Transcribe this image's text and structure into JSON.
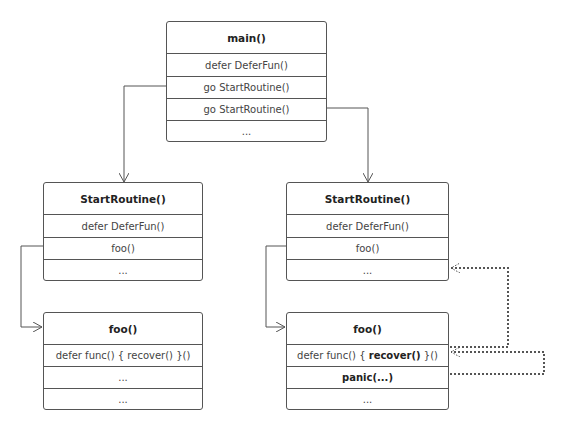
{
  "diagram": {
    "boxes": {
      "main": {
        "title": "main()",
        "rows": [
          "defer DeferFun()",
          "go StartRoutine()",
          "go StartRoutine()",
          "..."
        ]
      },
      "start_left": {
        "title": "StartRoutine()",
        "rows": [
          "defer DeferFun()",
          "foo()",
          "..."
        ]
      },
      "start_right": {
        "title": "StartRoutine()",
        "rows": [
          "defer DeferFun()",
          "foo()",
          "..."
        ]
      },
      "foo_left": {
        "title": "foo()",
        "rows": [
          "defer func() { recover() }()",
          "...",
          "..."
        ]
      },
      "foo_right": {
        "title": "foo()",
        "rows": [
          {
            "pre": "defer func() { ",
            "bold": "recover()",
            "post": " }()"
          },
          "panic(...)",
          "..."
        ]
      }
    },
    "edges": [
      {
        "from": "main.go StartRoutine() #1",
        "to": "start_left",
        "style": "solid"
      },
      {
        "from": "main.go StartRoutine() #2",
        "to": "start_right",
        "style": "solid"
      },
      {
        "from": "start_left.foo()",
        "to": "foo_left",
        "style": "solid"
      },
      {
        "from": "start_right.foo()",
        "to": "foo_right",
        "style": "solid"
      },
      {
        "from": "foo_right.panic(...)",
        "to": "foo_right.recover row",
        "style": "dotted"
      },
      {
        "from": "foo_right.recover row",
        "to": "start_right.... row",
        "style": "dotted"
      }
    ],
    "colors": {
      "line": "#555555",
      "text": "#444444",
      "background": "#ffffff"
    }
  }
}
